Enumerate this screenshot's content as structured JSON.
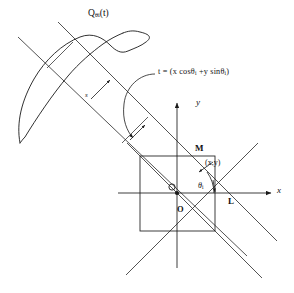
{
  "figure": {
    "background_color": "#ffffff",
    "stroke_color": "#1a1a1a",
    "width": 294,
    "height": 293
  },
  "labels": {
    "profile_curve": "Q",
    "profile_curve_sub": "θi",
    "profile_curve_arg": "(t)",
    "t_equation_lhs": "t = (x",
    "t_equation_cos": " cosθ",
    "t_equation_cos_sub": "i",
    "t_equation_mid": " +y  sinθ",
    "t_equation_sin_sub": "i",
    "t_equation_close": ")",
    "x_axis": "x",
    "y_axis": "y",
    "point_M": "M",
    "point_xy": "(x,y)",
    "angle_theta": "θ",
    "angle_theta_sub": "i",
    "origin_O": "O",
    "point_L": "L",
    "ray_coordinate_s": "s"
  },
  "geometry": {
    "origin": {
      "x": 177,
      "y": 193
    },
    "square": {
      "left": 140,
      "top": 156,
      "right": 215,
      "bottom": 231
    },
    "x_axis_line": {
      "x1": 118,
      "y1": 193,
      "x2": 272,
      "y2": 193
    },
    "y_axis_line": {
      "x1": 177,
      "y1": 265,
      "x2": 177,
      "y2": 104
    },
    "projection_angle_deg": 45,
    "band_line_a": {
      "x1": 18,
      "y1": 37,
      "x2": 247,
      "y2": 254
    },
    "band_line_b": {
      "x1": 58,
      "y1": 22,
      "x2": 276,
      "y2": 240
    },
    "profile_blob_centroid": {
      "x": 75,
      "y": 85
    }
  },
  "icons": {
    "x_axis_arrow": "arrow-right-icon",
    "y_axis_arrow": "arrow-up-icon",
    "callout_arrow": "curved-arrow-icon",
    "angle_arc_arrow": "arc-arrow-icon",
    "ray_direction_arrow": "arrow-icon",
    "origin_marker": "dot-icon",
    "circle_marker": "circle-outline-icon"
  }
}
